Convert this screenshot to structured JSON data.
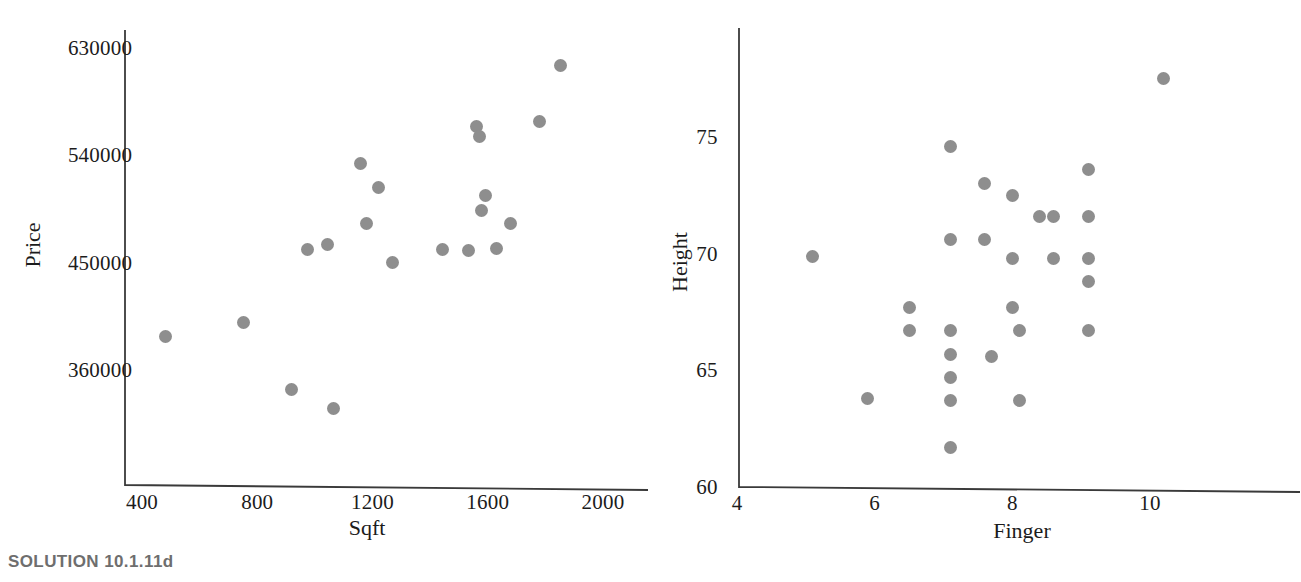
{
  "page": {
    "background_color": "#ffffff",
    "marker_color": "#8e8e8e",
    "axis_color": "#3a3a3a",
    "caption_color": "#6e6e6e"
  },
  "figures": [
    {
      "id": "price-vs-sqft",
      "caption": "SOLUTION 10.1.11d",
      "chart_data": {
        "type": "scatter",
        "title": "",
        "xlabel": "Sqft",
        "ylabel": "Price",
        "xlim": [
          330,
          2070
        ],
        "ylim": [
          300000,
          660000
        ],
        "grid": false,
        "legend": "none",
        "xticks": [
          400,
          800,
          1200,
          1600,
          2000
        ],
        "xticklabels": [
          "400",
          "800",
          "1200",
          "1600",
          "2000"
        ],
        "yticks": [
          360000,
          450000,
          540000,
          630000
        ],
        "yticklabels": [
          "360000",
          "450000",
          "540000",
          "630000"
        ],
        "points": [
          {
            "x": 480,
            "y": 388000
          },
          {
            "x": 752,
            "y": 400000
          },
          {
            "x": 920,
            "y": 344000
          },
          {
            "x": 1063,
            "y": 328000
          },
          {
            "x": 975,
            "y": 461000
          },
          {
            "x": 1044,
            "y": 465000
          },
          {
            "x": 1160,
            "y": 533000
          },
          {
            "x": 1220,
            "y": 513000
          },
          {
            "x": 1180,
            "y": 483000
          },
          {
            "x": 1270,
            "y": 450000
          },
          {
            "x": 1444,
            "y": 461000
          },
          {
            "x": 1533,
            "y": 460000
          },
          {
            "x": 1561,
            "y": 564000
          },
          {
            "x": 1571,
            "y": 556000
          },
          {
            "x": 1578,
            "y": 494000
          },
          {
            "x": 1593,
            "y": 506000
          },
          {
            "x": 1632,
            "y": 462000
          },
          {
            "x": 1678,
            "y": 483000
          },
          {
            "x": 1780,
            "y": 568000
          },
          {
            "x": 1854,
            "y": 615000
          }
        ]
      }
    },
    {
      "id": "height-vs-finger",
      "caption": "SOLUTION 10.1.13d",
      "chart_data": {
        "type": "scatter",
        "title": "",
        "xlabel": "Finger",
        "ylabel": "Height",
        "xlim": [
          4,
          11.2
        ],
        "ylim": [
          60,
          79
        ],
        "grid": false,
        "legend": "none",
        "xticks": [
          4,
          6,
          8,
          10
        ],
        "xticklabels": [
          "4",
          "6",
          "8",
          "10"
        ],
        "yticks": [
          60,
          65,
          70,
          75
        ],
        "yticklabels": [
          "60",
          "65",
          "70",
          "75"
        ],
        "points": [
          {
            "x": 5.1,
            "y": 69.9
          },
          {
            "x": 5.9,
            "y": 63.8
          },
          {
            "x": 6.5,
            "y": 67.7
          },
          {
            "x": 6.5,
            "y": 66.7
          },
          {
            "x": 7.1,
            "y": 74.6
          },
          {
            "x": 7.1,
            "y": 70.6
          },
          {
            "x": 7.1,
            "y": 66.7
          },
          {
            "x": 7.1,
            "y": 65.7
          },
          {
            "x": 7.1,
            "y": 64.7
          },
          {
            "x": 7.1,
            "y": 63.7
          },
          {
            "x": 7.1,
            "y": 61.7
          },
          {
            "x": 7.6,
            "y": 73.0
          },
          {
            "x": 7.6,
            "y": 70.6
          },
          {
            "x": 7.7,
            "y": 65.6
          },
          {
            "x": 8.0,
            "y": 72.5
          },
          {
            "x": 8.0,
            "y": 69.8
          },
          {
            "x": 8.0,
            "y": 67.7
          },
          {
            "x": 8.1,
            "y": 66.7
          },
          {
            "x": 8.1,
            "y": 63.7
          },
          {
            "x": 8.4,
            "y": 71.6
          },
          {
            "x": 8.6,
            "y": 71.6
          },
          {
            "x": 8.6,
            "y": 69.8
          },
          {
            "x": 9.1,
            "y": 73.6
          },
          {
            "x": 9.1,
            "y": 71.6
          },
          {
            "x": 9.1,
            "y": 69.8
          },
          {
            "x": 9.1,
            "y": 68.8
          },
          {
            "x": 9.1,
            "y": 66.7
          },
          {
            "x": 10.2,
            "y": 77.5
          }
        ]
      }
    }
  ]
}
